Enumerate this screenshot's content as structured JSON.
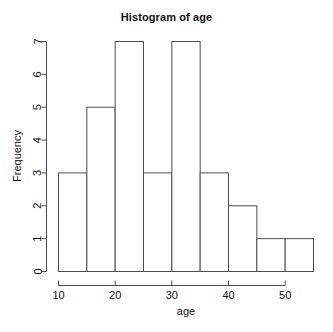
{
  "chart_data": {
    "type": "bar",
    "title": "Histogram of age",
    "xlabel": "age",
    "ylabel": "Frequency",
    "bin_width": 5,
    "bin_edges": [
      10,
      15,
      20,
      25,
      30,
      35,
      40,
      45,
      50,
      55
    ],
    "categories": [
      "10-15",
      "15-20",
      "20-25",
      "25-30",
      "30-35",
      "35-40",
      "40-45",
      "45-50",
      "50-55"
    ],
    "values": [
      3,
      5,
      7,
      3,
      7,
      3,
      2,
      1,
      1
    ],
    "xlim": [
      10,
      55
    ],
    "ylim": [
      0,
      7
    ],
    "xticks": [
      10,
      20,
      30,
      40,
      50
    ],
    "xtick_labels": [
      "10",
      "20",
      "30",
      "40",
      "50"
    ],
    "yticks": [
      0,
      1,
      2,
      3,
      4,
      5,
      6,
      7
    ],
    "ytick_labels": [
      "0",
      "1",
      "2",
      "3",
      "4",
      "5",
      "6",
      "7"
    ],
    "grid": false,
    "legend": null,
    "bar_fill_color": "#ffffff",
    "bar_border_color": "#4d4d4d",
    "axis_color": "#4d4d4d",
    "background_color": "#ffffff"
  }
}
